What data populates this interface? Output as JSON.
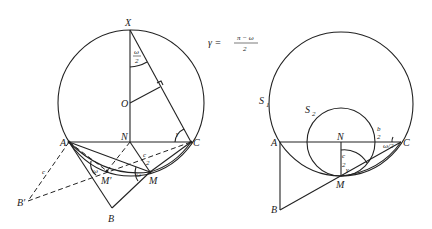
{
  "formula": {
    "lhs": "γ =",
    "numerator": "π − ω",
    "denominator": "2"
  },
  "left_figure": {
    "points": {
      "X": "X",
      "O": "O",
      "N": "N",
      "A": "A",
      "C": "C",
      "M": "M",
      "M_prime": "M′",
      "B": "B",
      "B_prime": "B′"
    },
    "angle_labels": {
      "omega_half_top_num": "ω",
      "omega_half_top_den": "2",
      "gamma": "γ",
      "omega_left": "ω",
      "omega_right": "ω",
      "c_half_num": "c",
      "c_half_den": "2",
      "c_side": "c"
    }
  },
  "right_figure": {
    "circle_labels": {
      "S1": "S",
      "S1_sub": "1",
      "S2": "S",
      "S2_sub": "2"
    },
    "points": {
      "A": "A",
      "N": "N",
      "C": "C",
      "M": "M",
      "B": "B"
    },
    "angle_labels": {
      "b_half_num": "b",
      "b_half_den": "2",
      "omega_half": "ω/2",
      "c_half_num": "c",
      "c_half_den": "2",
      "gamma": "γ"
    }
  }
}
